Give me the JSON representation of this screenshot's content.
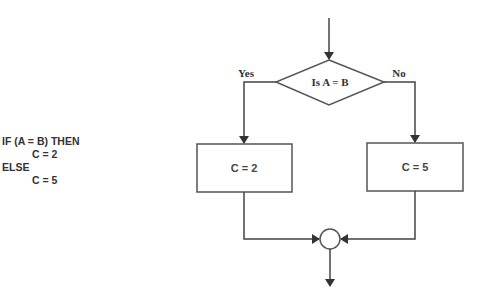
{
  "pseudocode": {
    "lines": [
      {
        "text": "IF (A = B) THEN",
        "indent": false
      },
      {
        "text": "C = 2",
        "indent": true
      },
      {
        "text": "ELSE",
        "indent": false
      },
      {
        "text": "C = 5",
        "indent": true
      }
    ]
  },
  "flowchart": {
    "decision": {
      "label": "Is A = B"
    },
    "yes_label": "Yes",
    "no_label": "No",
    "yes_process": {
      "label": "C = 2"
    },
    "no_process": {
      "label": "C = 5"
    },
    "stroke_color": "#444444"
  }
}
